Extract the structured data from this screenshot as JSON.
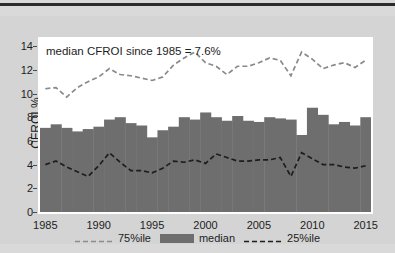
{
  "chart": {
    "title": "Food, Beverage & Tobacco",
    "annotation": "median CFROI since 1985 = 7.6%",
    "ylabel": "CFROI %"
  },
  "legend": {
    "p75": "75%ile",
    "median": "median",
    "p25": "25%ile"
  },
  "colors": {
    "bar": "#6e6e6e",
    "p75_line": "#8a8a8a",
    "p25_line": "#1d1d1d",
    "plot_bg": "#ffffff",
    "figure_bg": "#d4d4d4",
    "page_bg": "#d9d9d9",
    "text": "#1d1d1d"
  },
  "chart_data": {
    "type": "bar",
    "title": "Food, Beverage & Tobacco",
    "xlabel": "",
    "ylabel": "CFROI %",
    "xlim": [
      1984.5,
      2015.5
    ],
    "ylim": [
      0,
      14.6
    ],
    "yticks": [
      0,
      2,
      4,
      6,
      8,
      10,
      12,
      14
    ],
    "xticks": [
      1985,
      1990,
      1995,
      2000,
      2005,
      2010,
      2015
    ],
    "grid": false,
    "legend_position": "below",
    "annotations": [
      "median CFROI since 1985 = 7.6%"
    ],
    "categories": [
      1985,
      1986,
      1987,
      1988,
      1989,
      1990,
      1991,
      1992,
      1993,
      1994,
      1995,
      1996,
      1997,
      1998,
      1999,
      2000,
      2001,
      2002,
      2003,
      2004,
      2005,
      2006,
      2007,
      2008,
      2009,
      2010,
      2011,
      2012,
      2013,
      2014,
      2015
    ],
    "series": [
      {
        "name": "75%ile",
        "type": "line",
        "style": "dashed",
        "values": [
          10.4,
          10.5,
          9.7,
          10.5,
          11.0,
          11.4,
          12.1,
          11.6,
          11.5,
          11.3,
          11.1,
          11.4,
          12.4,
          13.0,
          13.5,
          12.6,
          12.3,
          11.6,
          12.3,
          12.3,
          12.6,
          13.0,
          12.8,
          11.5,
          13.5,
          12.9,
          12.1,
          12.4,
          12.6,
          12.2,
          12.8
        ]
      },
      {
        "name": "median",
        "type": "bar",
        "values": [
          7.1,
          7.4,
          7.1,
          6.8,
          7.0,
          7.2,
          7.8,
          8.0,
          7.5,
          7.3,
          6.3,
          6.9,
          7.2,
          8.0,
          7.8,
          8.4,
          8.0,
          7.7,
          8.1,
          7.7,
          7.6,
          8.0,
          7.9,
          7.8,
          6.5,
          8.8,
          8.2,
          7.4,
          7.6,
          7.3,
          8.0
        ]
      },
      {
        "name": "25%ile",
        "type": "line",
        "style": "dashed",
        "values": [
          4.0,
          4.3,
          3.8,
          3.4,
          3.0,
          3.9,
          5.0,
          4.2,
          3.5,
          3.5,
          3.3,
          3.7,
          4.3,
          4.2,
          4.4,
          4.1,
          4.9,
          4.6,
          4.3,
          4.3,
          4.4,
          4.4,
          4.6,
          3.0,
          5.0,
          4.5,
          4.0,
          4.0,
          3.8,
          3.7,
          3.9
        ]
      }
    ]
  }
}
